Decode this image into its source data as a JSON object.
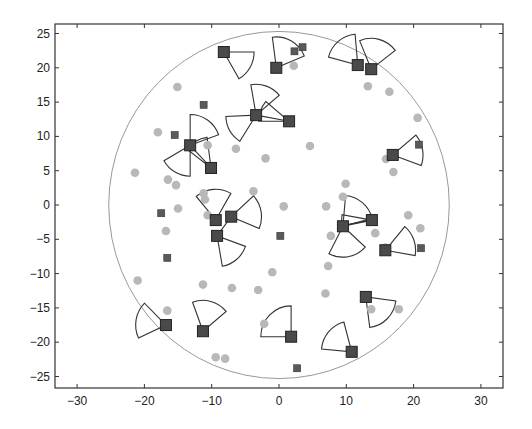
{
  "chart_data": {
    "type": "scatter",
    "title": "",
    "xlabel": "",
    "ylabel": "",
    "xlim": [
      -33,
      33.5
    ],
    "ylim": [
      -26.5,
      26.5
    ],
    "xticks": [
      -30,
      -20,
      -10,
      0,
      10,
      20,
      30
    ],
    "yticks": [
      -25,
      -20,
      -15,
      -10,
      -5,
      0,
      5,
      10,
      15,
      20,
      25
    ],
    "xtick_labels": [
      "−30",
      "−20",
      "−10",
      "0",
      "10",
      "20",
      "30"
    ],
    "ytick_labels": [
      "−25",
      "−20",
      "−15",
      "−10",
      "−5",
      "0",
      "5",
      "10",
      "15",
      "20",
      "25"
    ],
    "grid": false,
    "legend": null,
    "region_circle": {
      "cx": 0,
      "cy": 0,
      "r": 25.3
    },
    "sensing_radius": 4.5,
    "colors": {
      "sensor": "#4a4a4a",
      "sensor_edge": "#222222",
      "small_square": "#5a5a5a",
      "target": "#b8b8b8",
      "sector_edge": "#333333",
      "circle_edge": "#999999",
      "axis": "#333333"
    },
    "series": [
      {
        "name": "sensors",
        "marker": "large-square",
        "points": [
          {
            "x": -8.2,
            "y": 22.3,
            "dir": -30,
            "span": 60
          },
          {
            "x": -0.4,
            "y": 20.0,
            "dir": 60,
            "span": 75
          },
          {
            "x": 11.7,
            "y": 20.4,
            "dir": 130,
            "span": 70
          },
          {
            "x": 13.7,
            "y": 19.8,
            "dir": 75,
            "span": 75
          },
          {
            "x": -3.4,
            "y": 13.1,
            "dir": 70,
            "span": 60
          },
          {
            "x": -3.4,
            "y": 13.1,
            "dir": -150,
            "span": 55
          },
          {
            "x": 1.5,
            "y": 12.2,
            "dir": 160,
            "span": 40
          },
          {
            "x": -13.2,
            "y": 8.7,
            "dir": 55,
            "span": 70
          },
          {
            "x": -13.2,
            "y": 8.7,
            "dir": -120,
            "span": 60
          },
          {
            "x": -10.1,
            "y": 5.4,
            "dir": 120,
            "span": 45
          },
          {
            "x": 16.9,
            "y": 7.3,
            "dir": 10,
            "span": 60
          },
          {
            "x": -9.4,
            "y": -2.2,
            "dir": 95,
            "span": 70
          },
          {
            "x": -7.1,
            "y": -1.7,
            "dir": 10,
            "span": 65
          },
          {
            "x": -9.2,
            "y": -4.5,
            "dir": -50,
            "span": 60
          },
          {
            "x": 9.5,
            "y": -3.1,
            "dir": 50,
            "span": 70
          },
          {
            "x": 9.5,
            "y": -3.1,
            "dir": -80,
            "span": 75
          },
          {
            "x": 13.8,
            "y": -2.2,
            "dir": 180,
            "span": 20
          },
          {
            "x": 15.8,
            "y": -6.6,
            "dir": 20,
            "span": 60
          },
          {
            "x": -16.8,
            "y": -17.5,
            "dir": 170,
            "span": 70
          },
          {
            "x": -11.3,
            "y": -18.4,
            "dir": 75,
            "span": 70
          },
          {
            "x": 1.8,
            "y": -19.2,
            "dir": 135,
            "span": 90
          },
          {
            "x": 10.8,
            "y": -21.4,
            "dir": 140,
            "span": 70
          },
          {
            "x": 12.9,
            "y": -13.4,
            "dir": -45,
            "span": 75
          }
        ]
      },
      {
        "name": "small-squares",
        "marker": "small-square",
        "points": [
          {
            "x": 2.3,
            "y": 22.4
          },
          {
            "x": 3.5,
            "y": 23.0
          },
          {
            "x": -11.2,
            "y": 14.6
          },
          {
            "x": -15.5,
            "y": 10.2
          },
          {
            "x": 20.8,
            "y": 8.8
          },
          {
            "x": -17.5,
            "y": -1.2
          },
          {
            "x": 0.2,
            "y": -4.5
          },
          {
            "x": -16.6,
            "y": -7.7
          },
          {
            "x": 21.1,
            "y": -6.3
          },
          {
            "x": 2.7,
            "y": -23.8
          }
        ]
      },
      {
        "name": "targets",
        "marker": "circle",
        "points": [
          {
            "x": -15.1,
            "y": 17.2
          },
          {
            "x": 2.2,
            "y": 20.3
          },
          {
            "x": 13.2,
            "y": 17.3
          },
          {
            "x": 16.4,
            "y": 16.5
          },
          {
            "x": 20.6,
            "y": 12.7
          },
          {
            "x": -18.0,
            "y": 10.6
          },
          {
            "x": 4.6,
            "y": 8.6
          },
          {
            "x": -10.6,
            "y": 8.7
          },
          {
            "x": -6.4,
            "y": 8.2
          },
          {
            "x": -2.0,
            "y": 6.8
          },
          {
            "x": -21.4,
            "y": 4.7
          },
          {
            "x": 15.9,
            "y": 6.7
          },
          {
            "x": 17.0,
            "y": 4.8
          },
          {
            "x": -16.5,
            "y": 3.7
          },
          {
            "x": -15.3,
            "y": 2.9
          },
          {
            "x": -11.2,
            "y": 1.7
          },
          {
            "x": -3.8,
            "y": 2.0
          },
          {
            "x": 9.9,
            "y": 3.1
          },
          {
            "x": 9.5,
            "y": 1.2
          },
          {
            "x": 7.0,
            "y": -0.2
          },
          {
            "x": -15.0,
            "y": -0.5
          },
          {
            "x": -10.6,
            "y": -1.5
          },
          {
            "x": 13.7,
            "y": -2.0
          },
          {
            "x": 0.7,
            "y": -0.2
          },
          {
            "x": 14.3,
            "y": -4.1
          },
          {
            "x": 19.2,
            "y": -1.5
          },
          {
            "x": -16.8,
            "y": -3.8
          },
          {
            "x": 21.0,
            "y": -3.4
          },
          {
            "x": 15.8,
            "y": -6.2
          },
          {
            "x": 7.7,
            "y": -4.5
          },
          {
            "x": -21.0,
            "y": -11.0
          },
          {
            "x": -11.3,
            "y": -11.6
          },
          {
            "x": -7.0,
            "y": -12.1
          },
          {
            "x": -3.1,
            "y": -12.4
          },
          {
            "x": -1.0,
            "y": -9.8
          },
          {
            "x": 7.3,
            "y": -8.9
          },
          {
            "x": 6.9,
            "y": -12.9
          },
          {
            "x": -16.6,
            "y": -15.4
          },
          {
            "x": 13.7,
            "y": -15.2
          },
          {
            "x": 17.8,
            "y": -15.2
          },
          {
            "x": -2.2,
            "y": -17.3
          },
          {
            "x": -9.4,
            "y": -22.2
          },
          {
            "x": -8.0,
            "y": -22.4
          },
          {
            "x": 12.8,
            "y": -13.2
          },
          {
            "x": -11.0,
            "y": 0.8
          }
        ]
      }
    ],
    "links": [
      [
        [
          -13.2,
          8.7
        ],
        [
          -10.1,
          5.4
        ]
      ],
      [
        [
          -3.4,
          13.1
        ],
        [
          1.5,
          12.2
        ]
      ],
      [
        [
          -9.2,
          -4.5
        ],
        [
          -7.1,
          -1.7
        ]
      ],
      [
        [
          9.5,
          -3.1
        ],
        [
          13.8,
          -2.2
        ]
      ]
    ]
  },
  "plot_area": {
    "left": 55,
    "top": 24,
    "right": 503,
    "bottom": 388
  },
  "axis_map": {
    "x0_px": 279,
    "x_scale": 6.73,
    "y0_px": 205,
    "y_scale": 6.86
  }
}
